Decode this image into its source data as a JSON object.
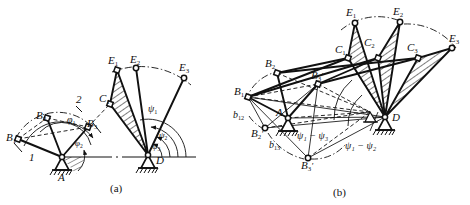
{
  "figure": {
    "stroke_color": "#111111",
    "hatch_color": "#111111",
    "background": "#ffffff",
    "captions": [
      {
        "id": "cap-a",
        "text": "(a)",
        "x": 110,
        "y": 184
      },
      {
        "id": "cap-b",
        "text": "(b)",
        "x": 333,
        "y": 190
      }
    ]
  },
  "panel_a": {
    "name": "(a)",
    "pivots": [
      {
        "id": "A",
        "label": "A",
        "x": 62,
        "y": 157
      },
      {
        "id": "D",
        "label": "D",
        "x": 148,
        "y": 155
      }
    ],
    "points": [
      {
        "id": "B1",
        "label": "B",
        "sub": "1",
        "x": 18,
        "y": 139,
        "lx": 6,
        "ly": 132
      },
      {
        "id": "B2",
        "label": "B",
        "sub": "2",
        "x": 47,
        "y": 118,
        "lx": 36,
        "ly": 110
      },
      {
        "id": "B3",
        "label": "B",
        "sub": "3",
        "x": 88,
        "y": 127,
        "lx": 87,
        "ly": 121
      },
      {
        "id": "C1",
        "label": "C",
        "sub": "1",
        "x": 110,
        "y": 104,
        "lx": 100,
        "ly": 97
      },
      {
        "id": "E1",
        "label": "E",
        "sub": "1",
        "x": 117,
        "y": 70,
        "lx": 110,
        "ly": 62
      },
      {
        "id": "E2",
        "label": "E",
        "sub": "2",
        "x": 136,
        "y": 68,
        "lx": 131,
        "ly": 60
      },
      {
        "id": "E3",
        "label": "E",
        "sub": "3",
        "x": 184,
        "y": 78,
        "lx": 181,
        "ly": 68
      }
    ],
    "link_numbers": [
      {
        "id": "link-1",
        "text": "1",
        "x": 31,
        "y": 155
      },
      {
        "id": "link-2",
        "text": "2",
        "x": 78,
        "y": 101
      }
    ],
    "angles": [
      {
        "id": "phi1",
        "text": "φ",
        "sub": "1",
        "x": 70,
        "y": 120
      },
      {
        "id": "phi2",
        "text": "φ",
        "sub": "2",
        "x": 77,
        "y": 144
      },
      {
        "id": "psi1",
        "text": "ψ",
        "sub": "1",
        "x": 150,
        "y": 110
      },
      {
        "id": "psi2",
        "text": "ψ",
        "sub": "2",
        "x": 161,
        "y": 136
      },
      {
        "id": "psi3",
        "text": "ψ",
        "sub": "3",
        "x": 155,
        "y": 148
      }
    ]
  },
  "panel_b": {
    "name": "(b)",
    "pivots": [
      {
        "id": "A",
        "label": "A",
        "x": 288,
        "y": 118,
        "lx": 277,
        "ly": 113
      },
      {
        "id": "D",
        "label": "D",
        "x": 385,
        "y": 117,
        "lx": 391,
        "ly": 118
      }
    ],
    "points": [
      {
        "id": "B1",
        "label": "B",
        "sub": "1",
        "prime": false,
        "x": 248,
        "y": 97,
        "lx": 237,
        "ly": 92
      },
      {
        "id": "B2",
        "label": "B",
        "sub": "2",
        "prime": false,
        "x": 277,
        "y": 73,
        "lx": 267,
        "ly": 64
      },
      {
        "id": "B3",
        "label": "B",
        "sub": "3",
        "prime": true,
        "x": 318,
        "y": 84,
        "lx": 313,
        "ly": 76
      },
      {
        "id": "B2p",
        "label": "B",
        "sub": "2",
        "prime": true,
        "x": 265,
        "y": 128,
        "lx": 253,
        "ly": 133
      },
      {
        "id": "B3p",
        "label": "B",
        "sub": "3",
        "prime": true,
        "x": 308,
        "y": 158,
        "lx": 303,
        "ly": 164
      },
      {
        "id": "C1",
        "label": "C",
        "sub": "1",
        "prime": false,
        "x": 348,
        "y": 58,
        "lx": 336,
        "ly": 50
      },
      {
        "id": "C2",
        "label": "C",
        "sub": "2",
        "prime": false,
        "x": 378,
        "y": 58,
        "lx": 365,
        "ly": 43
      },
      {
        "id": "C3",
        "label": "C",
        "sub": "3",
        "prime": false,
        "x": 418,
        "y": 58,
        "lx": 409,
        "ly": 48
      },
      {
        "id": "E1",
        "label": "E",
        "sub": "1",
        "prime": false,
        "x": 355,
        "y": 23,
        "lx": 348,
        "ly": 13
      },
      {
        "id": "E2",
        "label": "E",
        "sub": "2",
        "prime": false,
        "x": 400,
        "y": 22,
        "lx": 395,
        "ly": 12
      },
      {
        "id": "E3",
        "label": "E",
        "sub": "3",
        "prime": false,
        "x": 452,
        "y": 48,
        "lx": 451,
        "ly": 40
      }
    ],
    "pole_labels": [
      {
        "id": "b12",
        "text": "b",
        "sub": "12",
        "x": 237,
        "y": 116
      },
      {
        "id": "b13",
        "text": "b",
        "sub": "13",
        "x": 272,
        "y": 146
      }
    ],
    "angle_labels": [
      {
        "id": "psi1-psi3",
        "text": "ψ₁ − ψ₃",
        "x": 312,
        "y": 136
      },
      {
        "id": "psi1-psi2",
        "text": "ψ₁ − ψ₂",
        "x": 357,
        "y": 146
      }
    ]
  }
}
